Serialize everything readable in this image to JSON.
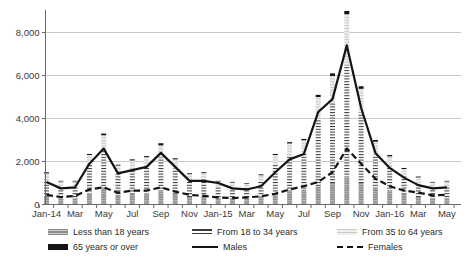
{
  "chart_data": {
    "type": "bar",
    "subtype": "stacked-bars-with-lines",
    "title": "",
    "xlabel": "",
    "ylabel": "",
    "ylim": [
      0,
      9200
    ],
    "grid": "horizontal",
    "y_tick_values": [
      0,
      2000,
      4000,
      6000,
      8000
    ],
    "y_tick_labels": [
      "0",
      "2,000",
      "4,000",
      "6,000",
      "8,000"
    ],
    "categories": [
      "Jan-14",
      "Feb-14",
      "Mar-14",
      "Apr-14",
      "May-14",
      "Jun-14",
      "Jul-14",
      "Aug-14",
      "Sep-14",
      "Oct-14",
      "Nov-14",
      "Dec-14",
      "Jan-15",
      "Feb-15",
      "Mar-15",
      "Apr-15",
      "May-15",
      "Jun-15",
      "Jul-15",
      "Aug-15",
      "Sep-15",
      "Oct-15",
      "Nov-15",
      "Dec-15",
      "Jan-16",
      "Feb-16",
      "Mar-16",
      "Apr-16",
      "May-16"
    ],
    "x_tick_labels": [
      "Jan-14",
      "Mar",
      "May",
      "Jul",
      "Sep",
      "Nov",
      "Jan-15",
      "Mar",
      "May",
      "Jul",
      "Sep",
      "Nov",
      "Jan-16",
      "Mar",
      "May"
    ],
    "series": [
      {
        "name": "Less than 18 years",
        "type": "bar-stack",
        "swatch": "u18",
        "values": [
          400,
          300,
          300,
          550,
          750,
          450,
          500,
          550,
          650,
          500,
          350,
          400,
          300,
          300,
          300,
          400,
          550,
          650,
          700,
          850,
          1000,
          1300,
          1000,
          800,
          650,
          500,
          350,
          300,
          300
        ]
      },
      {
        "name": "From 18 to 34 years",
        "type": "bar-stack",
        "swatch": "1834",
        "values": [
          750,
          550,
          550,
          1300,
          1820,
          1010,
          1150,
          1220,
          1550,
          1180,
          780,
          770,
          550,
          510,
          470,
          680,
          1300,
          1640,
          1690,
          3150,
          3780,
          5200,
          3280,
          1520,
          1140,
          820,
          650,
          510,
          550
        ]
      },
      {
        "name": "From 35 to 64 years",
        "type": "bar-stack",
        "swatch": "3564",
        "values": [
          300,
          220,
          220,
          450,
          650,
          350,
          400,
          430,
          550,
          420,
          280,
          290,
          220,
          210,
          200,
          280,
          450,
          550,
          600,
          1000,
          1200,
          2350,
          1100,
          600,
          450,
          330,
          260,
          210,
          220
        ]
      },
      {
        "name": "65 years or over",
        "type": "bar-stack",
        "swatch": "65",
        "values": [
          50,
          30,
          30,
          50,
          80,
          40,
          50,
          50,
          100,
          50,
          40,
          40,
          30,
          30,
          30,
          40,
          50,
          60,
          60,
          100,
          120,
          150,
          120,
          80,
          60,
          50,
          40,
          30,
          30
        ]
      },
      {
        "name": "Males",
        "type": "line",
        "style": "solid",
        "swatch": "line",
        "values": [
          1050,
          750,
          800,
          1900,
          2600,
          1450,
          1600,
          1750,
          2400,
          1750,
          1100,
          1100,
          1000,
          750,
          700,
          850,
          1500,
          2100,
          2350,
          4300,
          4900,
          7400,
          4500,
          2400,
          1700,
          1250,
          900,
          750,
          800
        ]
      },
      {
        "name": "Females",
        "type": "line",
        "style": "dashed",
        "swatch": "dash",
        "values": [
          450,
          350,
          400,
          700,
          800,
          550,
          650,
          650,
          800,
          600,
          450,
          400,
          330,
          300,
          330,
          380,
          500,
          700,
          850,
          1050,
          1500,
          2600,
          1900,
          1200,
          850,
          650,
          550,
          430,
          450
        ]
      }
    ],
    "legend_position": "bottom"
  },
  "legend": {
    "rows": 2,
    "cols": 3,
    "items": [
      {
        "label": "Less than 18 years",
        "swatch": "u18",
        "col": 0,
        "row": 0
      },
      {
        "label": "From 18 to 34 years",
        "swatch": "1834",
        "col": 1,
        "row": 0
      },
      {
        "label": "From 35 to 64 years",
        "swatch": "3564",
        "col": 2,
        "row": 0
      },
      {
        "label": "65 years or over",
        "swatch": "65",
        "col": 0,
        "row": 1
      },
      {
        "label": "Males",
        "swatch": "line",
        "col": 1,
        "row": 1
      },
      {
        "label": "Females",
        "swatch": "dash",
        "col": 2,
        "row": 1
      }
    ]
  },
  "colors": {
    "background": "#ffffff",
    "gridline": "#c8c8c8",
    "axis": "#6b6b6b",
    "tick_text": "#3a3a3a",
    "bar_under18": "#8f8f8f",
    "bar_under18_stripe": "#bdbdbd",
    "bar_1834_bg": "#ffffff",
    "bar_1834_stripe": "#3c3c3c",
    "bar_3564_bg": "#efefef",
    "bar_3564_stripe": "#c9c9c9",
    "bar_65plus": "#141414",
    "line_males": "#141414",
    "line_females": "#141414"
  }
}
